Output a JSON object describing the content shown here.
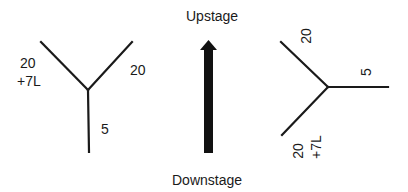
{
  "diagram": {
    "direction": {
      "top_label": "Upstage",
      "bottom_label": "Downstage",
      "arrow": "up"
    },
    "left_y": {
      "arm_upper_left": {
        "line1": "20",
        "line2": "+7L"
      },
      "arm_upper_right": "20",
      "arm_bottom": "5"
    },
    "right_y": {
      "arm_upper_left": "20",
      "arm_right": "5",
      "arm_lower_left": {
        "line1": "20",
        "line2": "+7L"
      }
    },
    "colors": {
      "line": "#1a1a1a",
      "background": "#ffffff"
    }
  }
}
